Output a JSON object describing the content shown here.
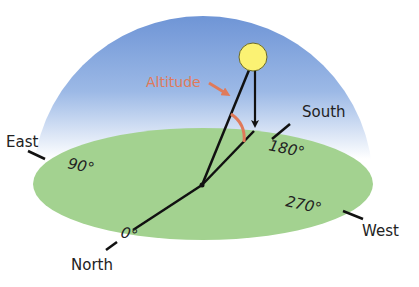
{
  "diagram": {
    "type": "celestial-coordinates",
    "labels": {
      "altitude": "Altitude",
      "south": "South",
      "east": "East",
      "west": "West",
      "north": "North",
      "deg0": "0°",
      "deg90": "90°",
      "deg180": "180°",
      "deg270": "270°"
    },
    "colors": {
      "sky_top": "#6f95d6",
      "sky_bottom": "#ffffff",
      "ground": "#9fd08c",
      "sun_fill": "#fbf273",
      "sun_stroke": "#6b6a2a",
      "altitude_accent": "#e07a5a",
      "lines": "#111111"
    }
  }
}
